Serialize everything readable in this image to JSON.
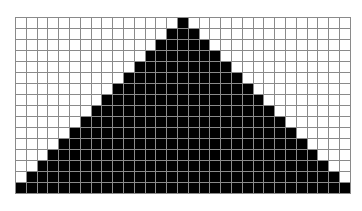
{
  "diagram": {
    "type": "pixel-grid",
    "columns": 31,
    "rows": 16,
    "colors": {
      "filled": "#000000",
      "empty": "#ffffff",
      "grid_line": "#8a8a8a"
    },
    "filled_cells_per_row": [
      {
        "row": 0,
        "start_col": 15,
        "end_col": 15
      },
      {
        "row": 1,
        "start_col": 14,
        "end_col": 16
      },
      {
        "row": 2,
        "start_col": 13,
        "end_col": 17
      },
      {
        "row": 3,
        "start_col": 12,
        "end_col": 18
      },
      {
        "row": 4,
        "start_col": 11,
        "end_col": 19
      },
      {
        "row": 5,
        "start_col": 10,
        "end_col": 20
      },
      {
        "row": 6,
        "start_col": 9,
        "end_col": 21
      },
      {
        "row": 7,
        "start_col": 8,
        "end_col": 22
      },
      {
        "row": 8,
        "start_col": 7,
        "end_col": 23
      },
      {
        "row": 9,
        "start_col": 6,
        "end_col": 24
      },
      {
        "row": 10,
        "start_col": 5,
        "end_col": 25
      },
      {
        "row": 11,
        "start_col": 4,
        "end_col": 26
      },
      {
        "row": 12,
        "start_col": 3,
        "end_col": 27
      },
      {
        "row": 13,
        "start_col": 2,
        "end_col": 28
      },
      {
        "row": 14,
        "start_col": 1,
        "end_col": 29
      },
      {
        "row": 15,
        "start_col": 0,
        "end_col": 30
      }
    ]
  }
}
